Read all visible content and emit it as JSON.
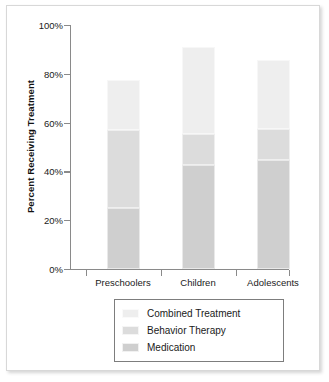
{
  "chart_data": {
    "type": "bar",
    "subtype": "stacked-bar",
    "title": "",
    "xlabel": "",
    "ylabel": "Percent Receiving Treatment",
    "categories": [
      "Preschoolers",
      "Children",
      "Adolescents"
    ],
    "ylim": [
      0,
      100
    ],
    "y_tick_labels": [
      "0%",
      "20%",
      "40%",
      "60%",
      "80%",
      "100%"
    ],
    "y_tick_values": [
      0,
      20,
      40,
      60,
      80,
      100
    ],
    "y_unit": "%",
    "grid": false,
    "legend_position": "bottom-center",
    "stack_order_bottom_to_top": [
      "Medication",
      "Behavior Therapy",
      "Combined Treatment"
    ],
    "series": [
      {
        "name": "Medication",
        "color": "#cfcfcf",
        "values": [
          25.0,
          42.5,
          44.5
        ]
      },
      {
        "name": "Behavior Therapy",
        "color": "#dcdcdc",
        "values": [
          32.0,
          13.0,
          13.0
        ]
      },
      {
        "name": "Combined Treatment",
        "color": "#eeeeee",
        "values": [
          20.5,
          35.5,
          28.0
        ]
      }
    ],
    "cumulative_tops": [
      {
        "category": "Preschoolers",
        "medication_top": 25.0,
        "behavior_top": 57.0,
        "bar_total": 77.5
      },
      {
        "category": "Children",
        "medication_top": 42.5,
        "behavior_top": 55.5,
        "bar_total": 91.0
      },
      {
        "category": "Adolescents",
        "medication_top": 44.5,
        "behavior_top": 57.5,
        "bar_total": 85.5
      }
    ]
  },
  "legend": {
    "items": [
      {
        "label": "Combined Treatment",
        "color": "#eeeeee"
      },
      {
        "label": "Behavior Therapy",
        "color": "#dcdcdc"
      },
      {
        "label": "Medication",
        "color": "#cfcfcf"
      }
    ]
  },
  "axis": {
    "y_title": "Percent Receiving Treatment"
  },
  "colors": {
    "axis_line": "#8a8a8a",
    "text": "#1a1a1a",
    "frame_border": "#d8d8d8",
    "legend_border": "#7d7d7d",
    "background": "#ffffff"
  }
}
